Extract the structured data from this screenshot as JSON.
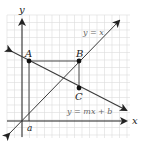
{
  "diagram": {
    "axes": {
      "x_label": "x",
      "y_label": "y"
    },
    "lines": [
      {
        "name": "identity-line",
        "equation": "y = x"
      },
      {
        "name": "linear-function-line",
        "equation": "y = mx + b"
      }
    ],
    "points": [
      {
        "name": "A",
        "label": "A"
      },
      {
        "name": "B",
        "label": "B"
      },
      {
        "name": "C",
        "label": "C"
      }
    ],
    "x_marker": "a",
    "colors": {
      "grid": "#d9d9d9",
      "axis": "#222222",
      "line": "#3a3a3a",
      "text": "#555555",
      "point": "#111111"
    }
  }
}
